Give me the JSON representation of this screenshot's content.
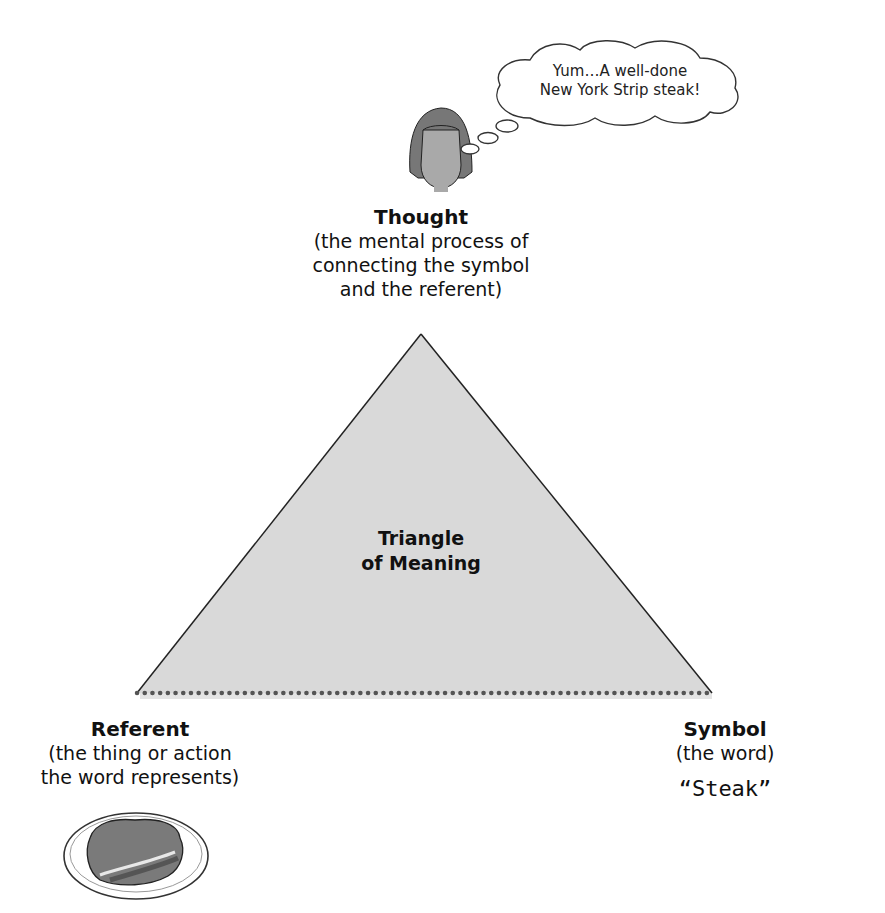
{
  "thought_bubble": {
    "line1": "Yum…A well-done",
    "line2": "New York Strip steak!"
  },
  "thought": {
    "title": "Thought",
    "desc_line1": "(the mental process of",
    "desc_line2": "connecting the symbol",
    "desc_line3": "and the referent)"
  },
  "triangle": {
    "label_line1": "Triangle",
    "label_line2": "of Meaning",
    "fill": "#d9d9d9",
    "stroke": "#222222",
    "base_dots_color": "#555555"
  },
  "referent": {
    "title": "Referent",
    "desc_line1": "(the thing or action",
    "desc_line2": "the word represents)"
  },
  "symbol": {
    "title": "Symbol",
    "desc": "(the word)",
    "word": "“Steak”"
  },
  "icons": [
    "person-thinking-icon",
    "thought-bubble-icon",
    "steak-plate-icon"
  ]
}
